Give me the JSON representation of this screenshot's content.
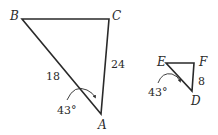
{
  "diagram": {
    "triangle_large": {
      "vertices": {
        "B": "B",
        "C": "C",
        "A": "A"
      },
      "side_BA": "18",
      "side_CA": "24",
      "angle_A": "43°"
    },
    "triangle_small": {
      "vertices": {
        "E": "E",
        "F": "F",
        "D": "D"
      },
      "side_FD": "8",
      "angle_D": "43°"
    },
    "colors": {
      "stroke": "#2a2a2a",
      "background": "#ffffff"
    }
  }
}
